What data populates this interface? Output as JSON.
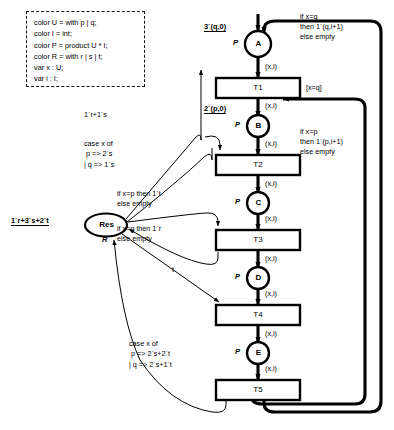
{
  "diagram": {
    "declarations": {
      "name": "declaration-box",
      "lines": [
        "color U = with p | q;",
        "color I = int;",
        "color P = product U * I;",
        "color R = with r | s | t;",
        "var x : U;",
        "var i : I;"
      ]
    },
    "places": [
      {
        "id": "A",
        "label": "A",
        "colorset": "P",
        "marking": "3`(q,0)"
      },
      {
        "id": "B",
        "label": "B",
        "colorset": "P",
        "marking": "2`(p,0)"
      },
      {
        "id": "C",
        "label": "C",
        "colorset": "P",
        "marking": ""
      },
      {
        "id": "D",
        "label": "D",
        "colorset": "P",
        "marking": ""
      },
      {
        "id": "E",
        "label": "E",
        "colorset": "P",
        "marking": ""
      },
      {
        "id": "Res",
        "label": "Res",
        "colorset": "R",
        "marking": "1`r+3`s+2`t"
      }
    ],
    "transitions": [
      {
        "id": "T1",
        "label": "T1",
        "guard": "[x=q]"
      },
      {
        "id": "T2",
        "label": "T2",
        "guard": ""
      },
      {
        "id": "T3",
        "label": "T3",
        "guard": ""
      },
      {
        "id": "T4",
        "label": "T4",
        "guard": ""
      },
      {
        "id": "T5",
        "label": "T5",
        "guard": ""
      }
    ],
    "arc_expressions": {
      "xi": "(x,i)",
      "loop_to_A": "if x=q\nthen 1`(q,i+1)\nelse empty",
      "loop_to_B": "if x=p\nthen 1`(p,i+1)\nelse empty",
      "res_to_T1": "1`r+1`s",
      "res_to_T2": "case x of\n p => 2`s\n| q => 1`s",
      "res_to_T3_a": "if x=p then 1`t\nelse empty",
      "res_to_T3_b": "if x=q then 1`r\nelse empty",
      "res_to_T4": "t",
      "res_to_T5": "case x of\n p => 2`s+2`t\n| q => 2`s+1`t"
    }
  }
}
